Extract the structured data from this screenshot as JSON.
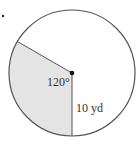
{
  "figure": {
    "type": "circle-sector",
    "angle_label": "120°",
    "radius_label": "10 yd",
    "angle_degrees": 120,
    "radius_value": 10,
    "radius_unit": "yd",
    "colors": {
      "outline": "#555555",
      "shaded": "#e4e4e4",
      "center_dot": "#111111",
      "background": "#ffffff"
    }
  }
}
